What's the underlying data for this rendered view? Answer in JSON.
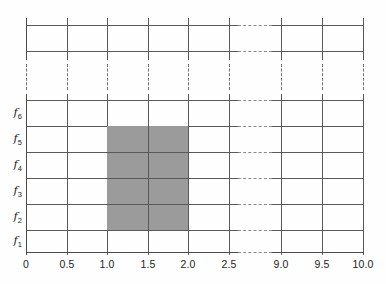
{
  "figure": {
    "title": "",
    "background": "#fefefe",
    "line_color": "#595959",
    "shade_color": "#9b9b9b",
    "text_color": "#1d1d1b"
  },
  "chart_data": {
    "type": "heatmap",
    "title": "",
    "xlabel": "",
    "ylabel": "",
    "grid": true,
    "legend": null,
    "x_tick_labels": [
      "0",
      "0.5",
      "1.0",
      "1.5",
      "2.0",
      "2.5",
      "9.0",
      "9.5",
      "10.0"
    ],
    "x_tick_values": [
      0,
      0.5,
      1.0,
      1.5,
      2.0,
      2.5,
      9.0,
      9.5,
      10.0
    ],
    "x_tick_pixels": [
      26,
      67,
      107,
      148,
      188,
      229,
      281,
      322,
      363
    ],
    "x_axis_break_between": [
      "2.5",
      "9.0"
    ],
    "y_tick_labels": [
      "f1",
      "f2",
      "f3",
      "f4",
      "f5",
      "f6"
    ],
    "y_tick_display": [
      "f",
      "f",
      "f",
      "f",
      "f",
      "f"
    ],
    "y_tick_subscripts": [
      "1",
      "2",
      "3",
      "4",
      "5",
      "6"
    ],
    "y_axis_break": true,
    "y_row_pixels": [
      241,
      217,
      191,
      165,
      139,
      113
    ],
    "horizontal_line_pixels": [
      25,
      51,
      100,
      126,
      152,
      178,
      204,
      230,
      252
    ],
    "vertical_line_pixels": [
      26,
      67,
      107,
      148,
      188,
      229,
      281,
      322,
      363
    ],
    "dashed_band": {
      "top": 64,
      "bottom": 90
    },
    "shaded_region": {
      "x_start": "1.0",
      "x_end": "2.0",
      "y_start": "f2",
      "y_end": "f5",
      "color": "#9b9b9b",
      "px": {
        "left": 107,
        "top": 126,
        "width": 81,
        "height": 104
      }
    }
  },
  "x_axis": {
    "ticks": [
      {
        "label": "0",
        "px": 26
      },
      {
        "label": "0.5",
        "px": 67
      },
      {
        "label": "1.0",
        "px": 107
      },
      {
        "label": "1.5",
        "px": 148
      },
      {
        "label": "2.0",
        "px": 188
      },
      {
        "label": "2.5",
        "px": 229
      },
      {
        "label": "9.0",
        "px": 281
      },
      {
        "label": "9.5",
        "px": 322
      },
      {
        "label": "10.0",
        "px": 363
      }
    ]
  },
  "y_axis": {
    "ticks": [
      {
        "base": "f",
        "sub": "6",
        "px": 113
      },
      {
        "base": "f",
        "sub": "5",
        "px": 139
      },
      {
        "base": "f",
        "sub": "4",
        "px": 165
      },
      {
        "base": "f",
        "sub": "3",
        "px": 191
      },
      {
        "base": "f",
        "sub": "2",
        "px": 217
      },
      {
        "base": "f",
        "sub": "1",
        "px": 241
      }
    ]
  }
}
